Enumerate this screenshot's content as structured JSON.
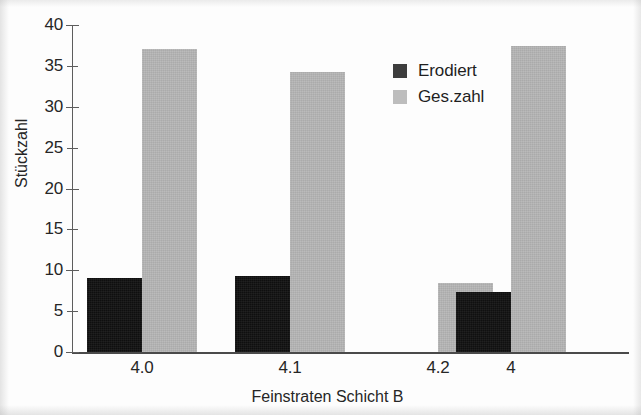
{
  "chart_data": {
    "type": "bar",
    "title": "",
    "xlabel": "Feinstraten Schicht B",
    "ylabel": "Stückzahl",
    "categories": [
      "4.0",
      "4.1",
      "4.2",
      "4"
    ],
    "series": [
      {
        "name": "Erodiert",
        "color": "#111111",
        "values": [
          9.1,
          9.3,
          0,
          7.4
        ]
      },
      {
        "name": "Ges.zahl",
        "color": "#b6b6b6",
        "values": [
          37.1,
          34.2,
          8.4,
          37.4
        ]
      }
    ],
    "ylim": [
      0,
      40
    ],
    "yticks": [
      0,
      5,
      10,
      15,
      20,
      25,
      30,
      35,
      40
    ],
    "ytick_labels": [
      "0",
      "5",
      "10",
      "15",
      "20",
      "25",
      "30",
      "35",
      "40"
    ],
    "grid": false,
    "legend_position": "top-right",
    "bar_group_layout": "adjacent-pairs",
    "annotations": []
  },
  "legend": {
    "entries": [
      {
        "label": "Erodiert",
        "swatch": "dark"
      },
      {
        "label": "Ges.zahl",
        "swatch": "light"
      }
    ]
  }
}
